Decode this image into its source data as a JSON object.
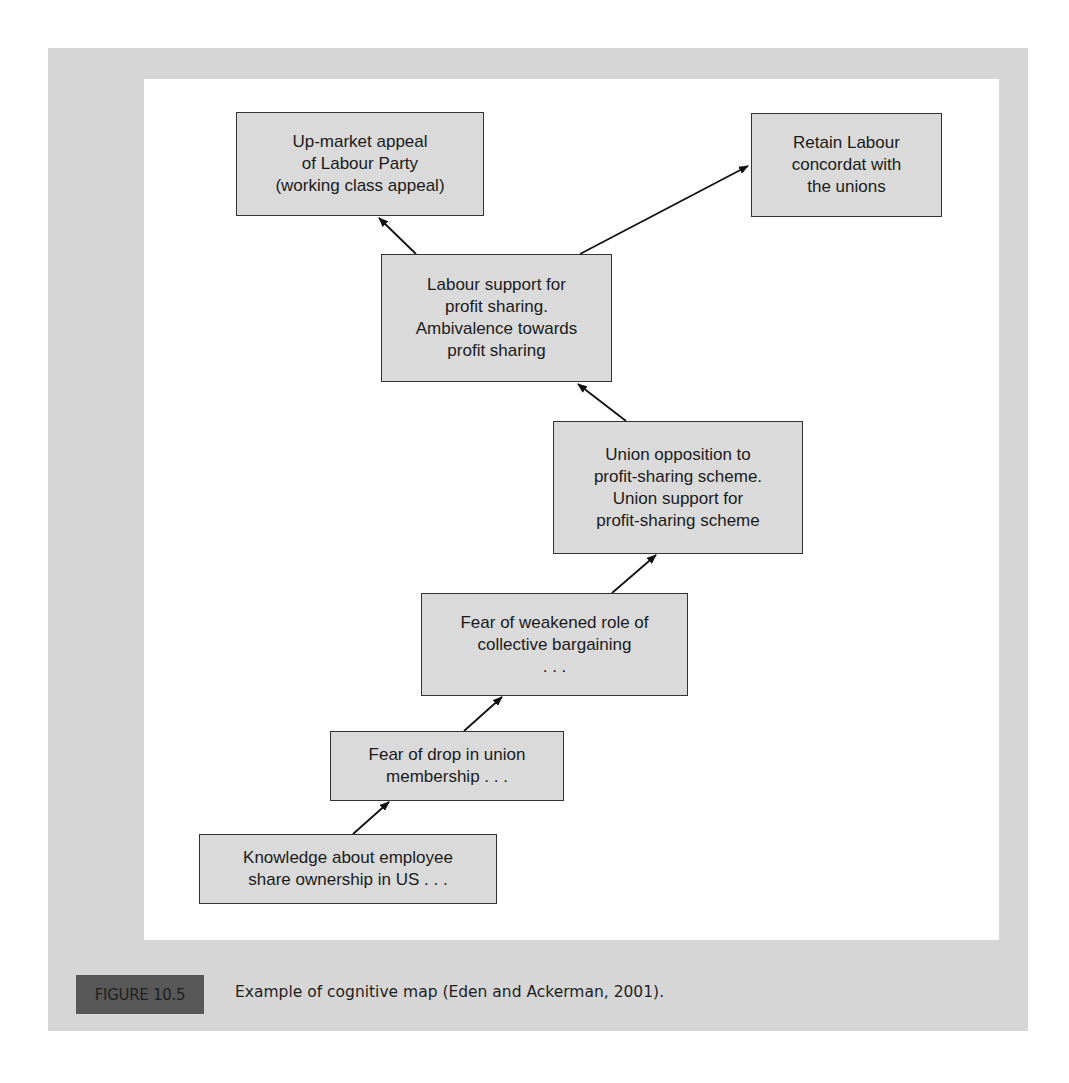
{
  "diagram": {
    "type": "cognitive-map",
    "nodes": [
      {
        "id": "upmarket",
        "text": "Up-market appeal\nof Labour Party\n(working class appeal)"
      },
      {
        "id": "retain",
        "text": "Retain Labour\nconcordat with\nthe unions"
      },
      {
        "id": "labour_support",
        "text": "Labour support for\nprofit sharing.\nAmbivalence towards\nprofit sharing"
      },
      {
        "id": "union_opposition",
        "text": "Union opposition to\nprofit-sharing scheme.\nUnion support for\nprofit-sharing scheme"
      },
      {
        "id": "fear_weakened",
        "text": "Fear of weakened role of\ncollective bargaining\n. . ."
      },
      {
        "id": "fear_drop",
        "text": "Fear of drop in union\nmembership . . ."
      },
      {
        "id": "knowledge",
        "text": "Knowledge about employee\nshare ownership in US . . ."
      }
    ],
    "edges": [
      {
        "from": "labour_support",
        "to": "upmarket"
      },
      {
        "from": "labour_support",
        "to": "retain"
      },
      {
        "from": "union_opposition",
        "to": "labour_support"
      },
      {
        "from": "fear_weakened",
        "to": "union_opposition"
      },
      {
        "from": "fear_drop",
        "to": "fear_weakened"
      },
      {
        "from": "knowledge",
        "to": "fear_drop"
      }
    ]
  },
  "figure": {
    "label": "FIGURE 10.5",
    "caption": "Example of cognitive map (Eden and Ackerman, 2001)."
  },
  "colors": {
    "panel": "#d6d6d6",
    "node_fill": "#dadada",
    "label_fill": "#585858"
  }
}
